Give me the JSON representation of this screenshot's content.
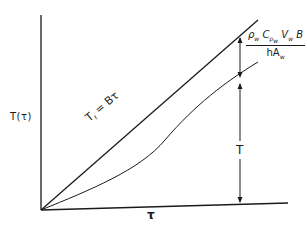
{
  "diagram": {
    "y_axis_label": "T(τ)",
    "x_axis_label": "τ",
    "upper_line_label": "T",
    "upper_line_label_sub": "f",
    "upper_line_label_rest": " = Bτ",
    "gap_label": {
      "numerator": "ρ",
      "numerator_parts": [
        "ρ",
        "w",
        " C",
        "p",
        "w",
        " V",
        "w",
        " B"
      ],
      "denominator_parts": [
        "hA",
        "w"
      ]
    },
    "response_label": "T",
    "colors": {
      "ink": "#1a1a1a",
      "background": "#ffffff"
    }
  }
}
